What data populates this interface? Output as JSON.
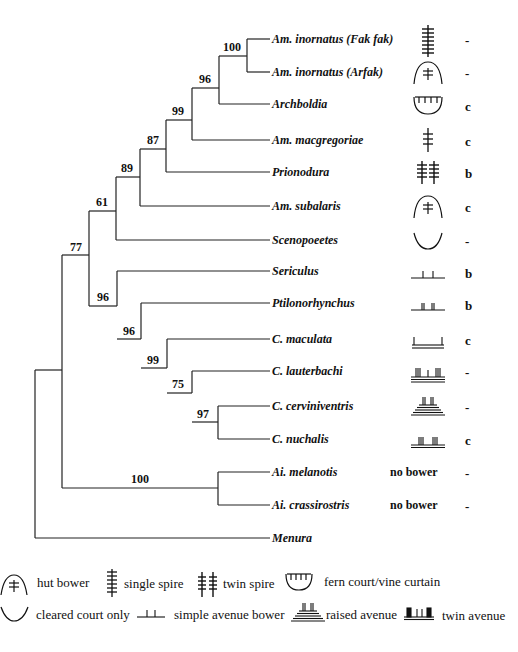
{
  "taxa": [
    {
      "name": "Am. inornatus (Fak fak)",
      "bower": "single spire",
      "code": "-"
    },
    {
      "name": "Am. inornatus (Arfak)",
      "bower": "hut bower",
      "code": "-"
    },
    {
      "name": "Archboldia",
      "bower": "fern court/vine curtain",
      "code": "c"
    },
    {
      "name": "Am. macgregoriae",
      "bower": "single spire",
      "code": "c"
    },
    {
      "name": "Prionodura",
      "bower": "twin spire",
      "code": "b"
    },
    {
      "name": "Am. subalaris",
      "bower": "hut bower",
      "code": "c"
    },
    {
      "name": "Scenopoeetes",
      "bower": "cleared court only",
      "code": "-"
    },
    {
      "name": "Sericulus",
      "bower": "simple avenue bower",
      "code": "b"
    },
    {
      "name": "Ptilonorhynchus",
      "bower": "simple avenue bower (double posts)",
      "code": "b"
    },
    {
      "name": "C. maculata",
      "bower": "simple avenue bower",
      "code": "c"
    },
    {
      "name": "C. lauterbachi",
      "bower": "twin avenue",
      "code": "-"
    },
    {
      "name": "C. cerviniventris",
      "bower": "raised avenue",
      "code": "-"
    },
    {
      "name": "C. nuchalis",
      "bower": "simple avenue bower (triple posts)",
      "code": "c"
    },
    {
      "name": "Ai. melanotis",
      "bower": "no bower",
      "code": "-"
    },
    {
      "name": "Ai. crassirostris",
      "bower": "no bower",
      "code": "-"
    },
    {
      "name": "Menura",
      "bower": "",
      "code": ""
    }
  ],
  "no_bower_label": "no bower",
  "support_values": [
    {
      "node": "inornatus pair",
      "value": "100"
    },
    {
      "node": "inornatus+Archboldia",
      "value": "96"
    },
    {
      "node": "+macgregoriae",
      "value": "99"
    },
    {
      "node": "+Prionodura",
      "value": "87"
    },
    {
      "node": "+subalaris",
      "value": "89"
    },
    {
      "node": "+Scenopoeetes",
      "value": "61"
    },
    {
      "node": "Bowerbirds excl. Ailuroedus",
      "value": "77"
    },
    {
      "node": "Sericulus clade",
      "value": "96"
    },
    {
      "node": "Ptilonorhynchus clade",
      "value": "96"
    },
    {
      "node": "Chlamydera",
      "value": "99"
    },
    {
      "node": "lauterbachi clade",
      "value": "75"
    },
    {
      "node": "cerviniventris+nuchalis",
      "value": "97"
    },
    {
      "node": "Ailuroedus",
      "value": "100"
    }
  ],
  "legend": {
    "hut_bower": "hut bower",
    "single_spire": "single spire",
    "twin_spire": "twin spire",
    "fern_court": "fern court/vine curtain",
    "cleared_court": "cleared court only",
    "simple_avenue": "simple avenue bower",
    "raised_avenue": "raised avenue",
    "twin_avenue": "twin avenue"
  }
}
